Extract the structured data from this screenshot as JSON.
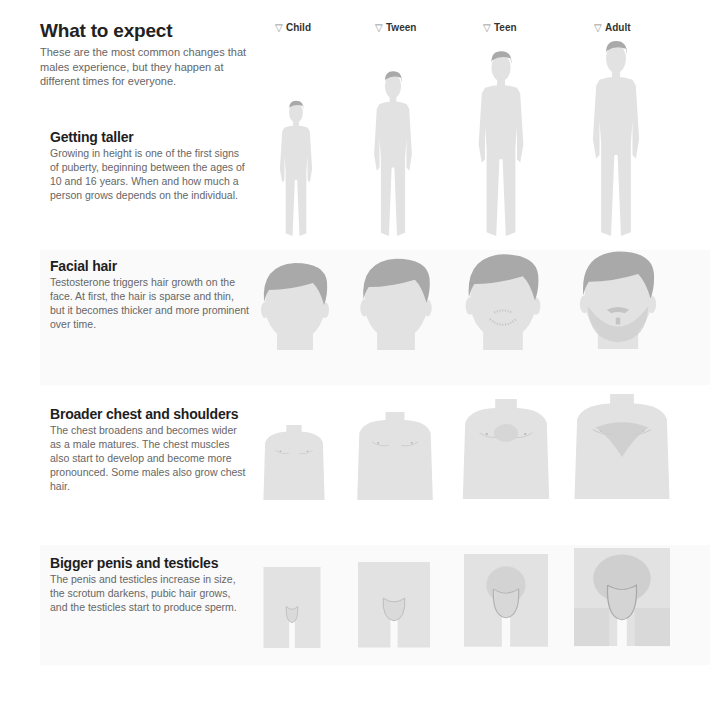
{
  "intro": {
    "title": "What to expect",
    "description": "These are the most common changes that males experience, but they happen at different times for everyone."
  },
  "stages": [
    {
      "label": "Child",
      "icon": "triangle-down-outline-icon"
    },
    {
      "label": "Tween",
      "icon": "triangle-down-outline-icon"
    },
    {
      "label": "Teen",
      "icon": "triangle-down-outline-icon"
    },
    {
      "label": "Adult",
      "icon": "triangle-down-outline-icon"
    }
  ],
  "sections": [
    {
      "title": "Getting taller",
      "text": "Growing in height is one of the first signs of puberty, beginning between the ages of 10 and 16 years. When and how much a person grows depends on the individual.",
      "illustration": "full-body-silhouette"
    },
    {
      "title": "Facial hair",
      "text": "Testosterone triggers hair growth on the face. At first, the hair is sparse and thin, but it becomes thicker and more prominent over time.",
      "illustration": "head-silhouette"
    },
    {
      "title": "Broader chest and shoulders",
      "text": "The chest broadens and becomes wider as a male matures. The chest muscles also start to develop and become more pronounced. Some males also grow chest hair.",
      "illustration": "torso-silhouette"
    },
    {
      "title": "Bigger penis and testicles",
      "text": "The penis and testicles increase in size, the scrotum darkens, pubic hair grows, and the testicles start to produce sperm.",
      "illustration": "groin-silhouette"
    }
  ],
  "colors": {
    "skin": "#e2e2e2",
    "hair": "#a9a9a9",
    "line": "#b8b8b8",
    "band": "#fafafa"
  }
}
